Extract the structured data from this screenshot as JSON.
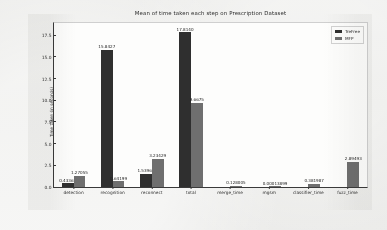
{
  "chart_data": {
    "type": "bar",
    "title": "Mean of time taken each step on Prescription Dataset",
    "xlabel": "",
    "ylabel": "Time taken (in seconds)",
    "ylim": [
      0,
      18.9
    ],
    "yticks": [
      "0.0",
      "2.5",
      "5.0",
      "7.5",
      "10.0",
      "12.5",
      "15.0",
      "17.5"
    ],
    "ytick_values": [
      0.0,
      2.5,
      5.0,
      7.5,
      10.0,
      12.5,
      15.0,
      17.5
    ],
    "grid": false,
    "legend_position": "upper right",
    "categories": [
      "detection",
      "recognition",
      "reconnect",
      "total",
      "merge_time",
      "mgsm",
      "classifier_time",
      "fuzz_time"
    ],
    "series": [
      {
        "name": "TreFree",
        "color": "#2f2f2f",
        "values": [
          0.43363,
          15.8427,
          1.53962,
          17.814,
          null,
          null,
          null,
          null
        ],
        "labels": [
          "0.43363",
          "15.8427",
          "1.53962",
          "17.8140",
          "",
          "",
          "",
          ""
        ]
      },
      {
        "name": "MFP",
        "color": "#6f6f6f",
        "values": [
          1.27055,
          0.64199,
          3.23429,
          9.6675,
          0.128005,
          0.00013899,
          0.381987,
          2.89493
        ],
        "labels": [
          "1.27055",
          "0.64199",
          "3.23429",
          "9.6675",
          "0.128005",
          "0.00013899",
          "0.381987",
          "2.89493"
        ]
      }
    ]
  },
  "legend": {
    "items": [
      {
        "label": "TreFree"
      },
      {
        "label": "MFP"
      }
    ]
  }
}
